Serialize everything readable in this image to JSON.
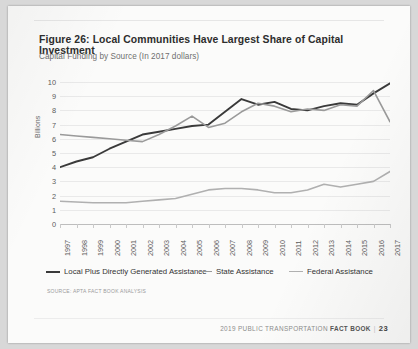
{
  "document": {
    "title": "Figure 26:  Local Communities Have Largest Share of Capital Investment",
    "subtitle": "Capital Funding by Source (In 2017 dollars)",
    "source_note": "SOURCE: APTA FACT BOOK ANALYSIS",
    "footer_year_text": "2019 PUBLIC TRANSPORTATION",
    "footer_book_text": "FACT BOOK",
    "footer_separator": "|",
    "page_number": "23"
  },
  "colors": {
    "series_local": "#3a3a3a",
    "series_state": "#9a9a9a",
    "series_federal": "#b0b0b0",
    "gridline": "#e9e9e9",
    "axis": "#bdbdbd",
    "page": "#fbfbfa"
  },
  "legend": {
    "position": "bottom",
    "items": [
      {
        "label": "Local Plus Directly Generated Assistance",
        "color": "#3a3a3a"
      },
      {
        "label": "State Assistance",
        "color": "#9a9a9a"
      },
      {
        "label": "Federal Assistance",
        "color": "#b0b0b0"
      }
    ]
  },
  "chart_data": {
    "type": "line",
    "title": "Figure 26:  Local Communities Have Largest Share of Capital Investment",
    "subtitle": "Capital Funding by Source (In 2017 dollars)",
    "xlabel": "",
    "ylabel": "Billions",
    "ylim": [
      0,
      10
    ],
    "yticks": [
      0,
      1,
      2,
      3,
      4,
      5,
      6,
      7,
      8,
      9,
      10
    ],
    "grid": true,
    "categories": [
      "1997",
      "1998",
      "1999",
      "2000",
      "2001",
      "2002",
      "2003",
      "2004",
      "2005",
      "2006",
      "2007",
      "2008",
      "2009",
      "2010",
      "2011",
      "2012",
      "2013",
      "2014",
      "2015",
      "2016",
      "2017"
    ],
    "series": [
      {
        "name": "Local Plus Directly Generated Assistance",
        "color": "#3a3a3a",
        "values": [
          4.0,
          4.4,
          4.7,
          5.3,
          5.8,
          6.3,
          6.5,
          6.7,
          6.9,
          7.0,
          7.9,
          8.8,
          8.4,
          8.6,
          8.1,
          8.0,
          8.3,
          8.5,
          8.4,
          9.2,
          9.9
        ]
      },
      {
        "name": "State Assistance",
        "color": "#9a9a9a",
        "values": [
          6.3,
          6.2,
          6.1,
          6.0,
          5.9,
          5.8,
          6.3,
          6.9,
          7.6,
          6.8,
          7.1,
          7.9,
          8.5,
          8.3,
          7.9,
          8.1,
          8.0,
          8.4,
          8.3,
          9.4,
          7.2
        ]
      },
      {
        "name": "Federal Assistance",
        "color": "#b0b0b0",
        "values": [
          1.6,
          1.55,
          1.5,
          1.5,
          1.5,
          1.6,
          1.7,
          1.8,
          2.1,
          2.4,
          2.5,
          2.5,
          2.4,
          2.2,
          2.2,
          2.4,
          2.8,
          2.6,
          2.8,
          3.0,
          3.7
        ]
      }
    ]
  }
}
